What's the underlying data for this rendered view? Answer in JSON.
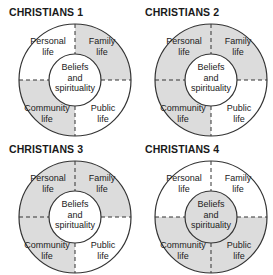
{
  "colors": {
    "shaded": "#dcdcdc",
    "unshaded": "#ffffff",
    "stroke": "#333333"
  },
  "labels": {
    "personal": [
      "Personal",
      "life"
    ],
    "family": [
      "Family",
      "life"
    ],
    "community": [
      "Community",
      "life"
    ],
    "public": [
      "Public",
      "life"
    ],
    "beliefs": [
      "Beliefs",
      "and",
      "spirituality"
    ]
  },
  "diagrams": [
    {
      "title": "CHRISTIANS 1",
      "shaded": {
        "personal": false,
        "family": true,
        "community": true,
        "public": false,
        "beliefs": false
      }
    },
    {
      "title": "CHRISTIANS 2",
      "shaded": {
        "personal": true,
        "family": true,
        "community": true,
        "public": false,
        "beliefs": false
      }
    },
    {
      "title": "CHRISTIANS 3",
      "shaded": {
        "personal": true,
        "family": true,
        "community": true,
        "public": false,
        "beliefs": false
      }
    },
    {
      "title": "CHRISTIANS 4",
      "shaded": {
        "personal": false,
        "family": false,
        "community": true,
        "public": true,
        "beliefs": true
      }
    }
  ]
}
